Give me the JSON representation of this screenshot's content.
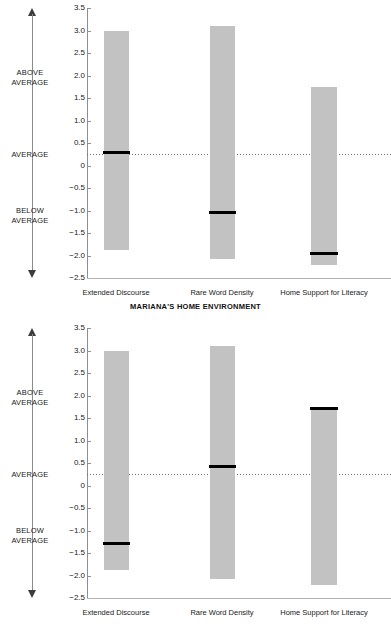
{
  "chart_data": [
    {
      "type": "bar",
      "panel_id": "mariana",
      "title": "MARIANA'S HOME ENVIRONMENT",
      "xlabel": "",
      "ylabel": "",
      "ylim": [
        -2.5,
        3.5
      ],
      "ytick_values": [
        3.5,
        3.0,
        2.5,
        2.0,
        1.5,
        1.0,
        0.5,
        0,
        -0.5,
        -1.0,
        -1.5,
        -2.0,
        -2.5
      ],
      "ytick_labels": [
        "3.5",
        "3.0",
        "2.5",
        "2.0",
        "1.5",
        "1.0",
        "0.5",
        "0",
        "−0.5",
        "−1.0",
        "−1.5",
        "−2.0",
        "−2.5"
      ],
      "grid": false,
      "zero_line": true,
      "zero_line_style": "dotted",
      "categories": [
        "Extended Discourse",
        "Rare Word Density",
        "Home Support for Literacy"
      ],
      "range_low": [
        -1.87,
        -2.08,
        -2.22
      ],
      "range_high": [
        3.0,
        3.1,
        1.75
      ],
      "values": [
        0.29,
        -1.05,
        -1.95
      ],
      "series": [
        {
          "name": "Range of scores",
          "type": "range",
          "low": [
            -1.87,
            -2.08,
            -2.22
          ],
          "high": [
            3.0,
            3.1,
            1.75
          ],
          "color": "#c2c2c2"
        },
        {
          "name": "Child's score",
          "type": "marker",
          "values": [
            0.29,
            -1.05,
            -1.95
          ],
          "color": "#000000"
        }
      ],
      "axis_annotations": [
        {
          "label": "ABOVE AVERAGE",
          "position": "upper"
        },
        {
          "label": "AVERAGE",
          "position": "zero"
        },
        {
          "label": "BELOW AVERAGE",
          "position": "lower"
        }
      ]
    },
    {
      "type": "bar",
      "panel_id": "casey",
      "title": "CASEY'S HOME ENVIRONMENT",
      "xlabel": "",
      "ylabel": "",
      "ylim": [
        -2.5,
        3.5
      ],
      "ytick_values": [
        3.5,
        3.0,
        2.5,
        2.0,
        1.5,
        1.0,
        0.5,
        0,
        -0.5,
        -1.0,
        -1.5,
        -2.0,
        -2.5
      ],
      "ytick_labels": [
        "3.5",
        "3.0",
        "2.5",
        "2.0",
        "1.5",
        "1.0",
        "0.5",
        "0",
        "−0.5",
        "−1.0",
        "−1.5",
        "−2.0",
        "−2.5"
      ],
      "grid": false,
      "zero_line": true,
      "zero_line_style": "dotted",
      "categories": [
        "Extended Discourse",
        "Rare Word Density",
        "Home Support for Literacy"
      ],
      "range_low": [
        -1.87,
        -2.08,
        -2.22
      ],
      "range_high": [
        3.0,
        3.1,
        1.75
      ],
      "values": [
        -1.28,
        0.42,
        1.72
      ],
      "series": [
        {
          "name": "Range of scores",
          "type": "range",
          "low": [
            -1.87,
            -2.08,
            -2.22
          ],
          "high": [
            3.0,
            3.1,
            1.75
          ],
          "color": "#c2c2c2"
        },
        {
          "name": "Child's score",
          "type": "marker",
          "values": [
            -1.28,
            0.42,
            1.72
          ],
          "color": "#000000"
        }
      ],
      "axis_annotations": [
        {
          "label": "ABOVE AVERAGE",
          "position": "upper"
        },
        {
          "label": "AVERAGE",
          "position": "zero"
        },
        {
          "label": "BELOW AVERAGE",
          "position": "lower"
        }
      ]
    }
  ],
  "labels": {
    "above_average": "ABOVE\nAVERAGE",
    "above_average_l1": "ABOVE",
    "above_average_l2": "AVERAGE",
    "average": "AVERAGE",
    "below_average_l1": "BELOW",
    "below_average_l2": "AVERAGE"
  },
  "colors": {
    "bar_fill": "#c2c2c2",
    "marker": "#000000",
    "axis": "#8f8f8f",
    "text": "#1a1a1a",
    "background": "#ffffff"
  }
}
